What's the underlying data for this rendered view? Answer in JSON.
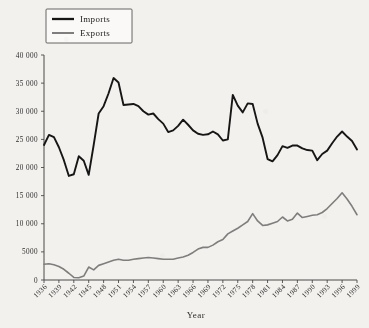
{
  "chart_data": {
    "type": "line",
    "title": "",
    "xlabel": "Year",
    "ylabel": "",
    "xlim": [
      1936,
      1999
    ],
    "ylim": [
      0,
      40000
    ],
    "grid": false,
    "legend_position": "top-left",
    "x_tick_labels": [
      "1936",
      "1939",
      "1942",
      "1945",
      "1948",
      "1951",
      "1954",
      "1957",
      "1960",
      "1963",
      "1966",
      "1969",
      "1972",
      "1975",
      "1978",
      "1981",
      "1984",
      "1987",
      "1990",
      "1993",
      "1996",
      "1999"
    ],
    "y_tick_labels": [
      "0",
      "5000",
      "10 000",
      "15 000",
      "20 000",
      "25 000",
      "30 000",
      "35 000",
      "40 000"
    ],
    "y_tick_values": [
      0,
      5000,
      10000,
      15000,
      20000,
      25000,
      30000,
      35000,
      40000
    ],
    "x": [
      1936,
      1937,
      1938,
      1939,
      1940,
      1941,
      1942,
      1943,
      1944,
      1945,
      1946,
      1947,
      1948,
      1949,
      1950,
      1951,
      1952,
      1953,
      1954,
      1955,
      1956,
      1957,
      1958,
      1959,
      1960,
      1961,
      1962,
      1963,
      1964,
      1965,
      1966,
      1967,
      1968,
      1969,
      1970,
      1971,
      1972,
      1973,
      1974,
      1975,
      1976,
      1977,
      1978,
      1979,
      1980,
      1981,
      1982,
      1983,
      1984,
      1985,
      1986,
      1987,
      1988,
      1989,
      1990,
      1991,
      1992,
      1993,
      1994,
      1995,
      1996,
      1997,
      1998,
      1999
    ],
    "series": [
      {
        "name": "Imports",
        "color": "#161616",
        "values": [
          24000,
          25800,
          25400,
          23600,
          21300,
          18500,
          18800,
          22000,
          21200,
          18700,
          24000,
          29600,
          30900,
          33200,
          35900,
          35100,
          31100,
          31200,
          31300,
          30900,
          30000,
          29400,
          29600,
          28600,
          27800,
          26300,
          26600,
          27400,
          28500,
          27600,
          26600,
          26000,
          25800,
          25900,
          26400,
          25900,
          24800,
          25000,
          32900,
          31000,
          29800,
          31400,
          31300,
          27800,
          25300,
          21500,
          21100,
          22200,
          23800,
          23500,
          23900,
          23900,
          23400,
          23100,
          23000,
          21300,
          22400,
          23000,
          24300,
          25500,
          26400,
          25500,
          24700,
          23200
        ]
      },
      {
        "name": "Exports",
        "color": "#7e7e7e",
        "values": [
          2800,
          2900,
          2700,
          2400,
          1900,
          1200,
          450,
          400,
          700,
          2300,
          1800,
          2600,
          2900,
          3200,
          3500,
          3700,
          3500,
          3500,
          3700,
          3800,
          3900,
          4000,
          3900,
          3800,
          3700,
          3700,
          3700,
          3900,
          4100,
          4400,
          4900,
          5500,
          5800,
          5800,
          6200,
          6800,
          7200,
          8200,
          8700,
          9200,
          9800,
          10400,
          11800,
          10500,
          9700,
          9800,
          10100,
          10400,
          11200,
          10500,
          10800,
          11900,
          11100,
          11300,
          11500,
          11600,
          12000,
          12700,
          13600,
          14500,
          15500,
          14400,
          13100,
          11600
        ]
      }
    ]
  },
  "legend": {
    "items": [
      {
        "label": "Imports"
      },
      {
        "label": "Exports"
      }
    ]
  },
  "axis": {
    "x_title": "Year"
  }
}
